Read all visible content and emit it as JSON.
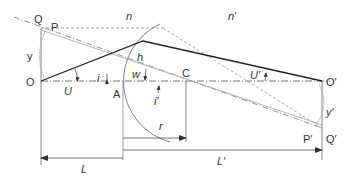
{
  "diagram": {
    "colors": {
      "ray": "#222222",
      "construction": "#888888",
      "light": "#aaaaaa",
      "axis": "#444444"
    },
    "labels": {
      "Q": "Q",
      "P": "P",
      "n": "n",
      "n_prime": "n′",
      "y": "y",
      "O": "O",
      "U": "U",
      "i": "i",
      "A": "A",
      "h": "h",
      "w": "w",
      "C": "C",
      "i_prime": "i′",
      "U_prime": "U′",
      "O_prime": "O′",
      "r": "r",
      "y_prime": "y′",
      "P_prime": "P′",
      "Q_prime": "Q′",
      "L": "L",
      "L_prime": "L′"
    }
  }
}
